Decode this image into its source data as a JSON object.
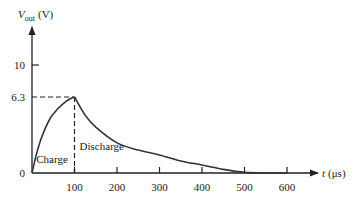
{
  "chart_data": {
    "type": "line",
    "title": "",
    "ylabel_var": "V",
    "ylabel_sub": "out",
    "ylabel_unit": "(V)",
    "xlabel_var": "t",
    "xlabel_unit": "(μs)",
    "x_ticks": [
      100,
      200,
      300,
      400,
      500,
      600
    ],
    "x_tick_labels": [
      "100",
      "200",
      "300",
      "400",
      "500",
      "600"
    ],
    "y_ticks": [
      0,
      6.3,
      10
    ],
    "y_tick_labels": [
      "0",
      "6.3",
      "10"
    ],
    "xlim": [
      0,
      650
    ],
    "ylim": [
      0,
      12
    ],
    "grid": false,
    "peak": {
      "t": 100,
      "v": 6.3
    },
    "annotations": [
      {
        "text": "Charge",
        "t": 10,
        "v": 0.8
      },
      {
        "text": "Discharge",
        "t": 112,
        "v": 1.9
      }
    ],
    "series": [
      {
        "name": "Vout",
        "x": [
          0,
          10,
          20,
          30,
          44,
          60,
          75,
          90,
          100,
          125,
          150,
          200,
          250,
          300,
          350,
          400,
          450,
          500,
          550,
          600
        ],
        "y": [
          0,
          1.5,
          2.7,
          3.6,
          4.6,
          5.3,
          5.8,
          6.15,
          6.3,
          4.8,
          3.8,
          2.5,
          1.9,
          1.5,
          1.0,
          0.66,
          0.3,
          0.05,
          0.0,
          0.0
        ]
      }
    ]
  }
}
